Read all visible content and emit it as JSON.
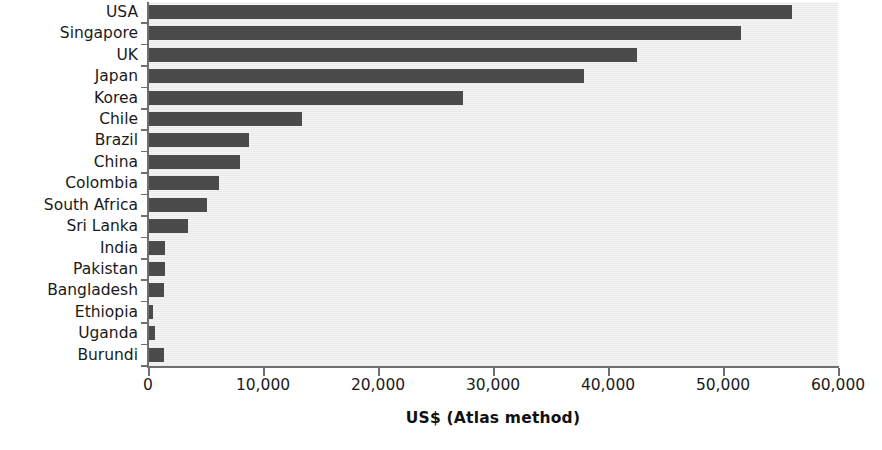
{
  "chart_data": {
    "type": "bar",
    "orientation": "horizontal",
    "title": "",
    "xlabel": "US$ (Atlas method)",
    "ylabel": "",
    "xlim": [
      0,
      60000
    ],
    "xticks": [
      0,
      10000,
      20000,
      30000,
      40000,
      50000,
      60000
    ],
    "xtick_labels": [
      "0",
      "10,000",
      "20,000",
      "30,000",
      "40,000",
      "50,000",
      "60,000"
    ],
    "grid": false,
    "legend": null,
    "categories": [
      "USA",
      "Singapore",
      "UK",
      "Japan",
      "Korea",
      "Chile",
      "Brazil",
      "China",
      "Colombia",
      "South Africa",
      "Sri Lanka",
      "India",
      "Pakistan",
      "Bangladesh",
      "Ethiopia",
      "Uganda",
      "Burundi"
    ],
    "values": [
      56000,
      51600,
      42500,
      37900,
      27400,
      13400,
      8800,
      8000,
      6200,
      5100,
      3500,
      1500,
      1500,
      1400,
      400,
      600,
      1400
    ],
    "colors": {
      "bar": "#4b4b4b",
      "plot_background": "#ececec",
      "axis": "#6f6f6f",
      "text": "#1a1a1a",
      "page_background": "#ffffff"
    }
  }
}
